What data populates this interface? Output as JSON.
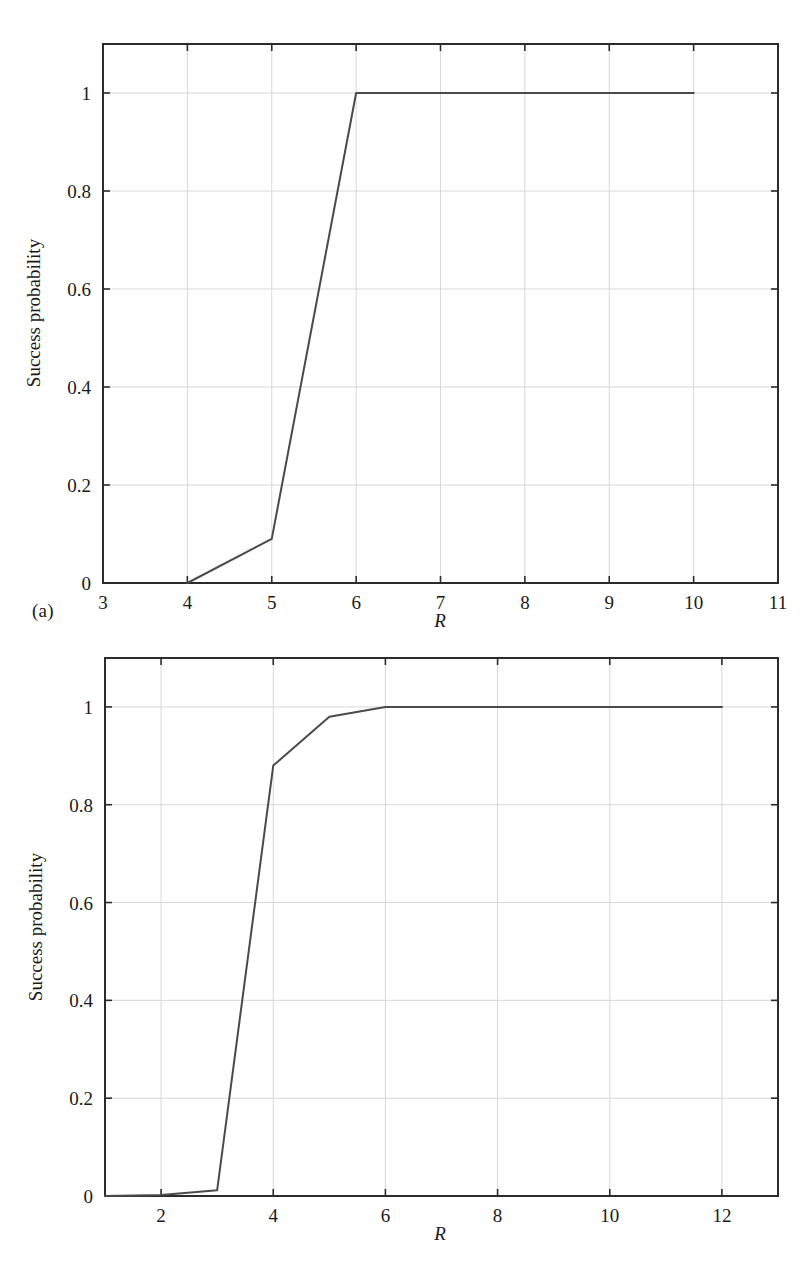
{
  "figure": {
    "panels": [
      {
        "id": "a",
        "label": "(a)",
        "xlabel": "R",
        "ylabel": "Success probability",
        "x_ticks": [
          "3",
          "4",
          "5",
          "6",
          "7",
          "8",
          "9",
          "10",
          "11"
        ],
        "y_ticks": [
          "0",
          "0.2",
          "0.4",
          "0.6",
          "0.8",
          "1"
        ]
      },
      {
        "id": "b",
        "label": "(b)",
        "xlabel": "R",
        "ylabel": "Success probability",
        "x_ticks": [
          "2",
          "4",
          "6",
          "8",
          "10",
          "12"
        ],
        "y_ticks": [
          "0",
          "0.2",
          "0.4",
          "0.6",
          "0.8",
          "1"
        ]
      }
    ],
    "colors": {
      "line": "#4a4a4a",
      "axis": "#2b2b2b",
      "grid": "#d8d8d8",
      "background": "#ffffff",
      "text": "#1a1a1a"
    }
  },
  "chart_data": [
    {
      "type": "line",
      "panel": "a",
      "title": "",
      "xlabel": "R",
      "ylabel": "Success probability",
      "xlim": [
        3,
        11
      ],
      "ylim": [
        0,
        1.1
      ],
      "xticks": [
        3,
        4,
        5,
        6,
        7,
        8,
        9,
        10,
        11
      ],
      "xticklabels": [
        "3",
        "4",
        "5",
        "6",
        "7",
        "8",
        "9",
        "10",
        "11"
      ],
      "yticks": [
        0,
        0.2,
        0.4,
        0.6,
        0.8,
        1
      ],
      "yticklabels": [
        "0",
        "0.2",
        "0.4",
        "0.6",
        "0.8",
        "1"
      ],
      "grid": true,
      "legend": null,
      "series": [
        {
          "name": "Success probability",
          "x": [
            4,
            5,
            6,
            7,
            8,
            9,
            10
          ],
          "values": [
            0,
            0.09,
            1.0,
            1.0,
            1.0,
            1.0,
            1.0
          ]
        }
      ]
    },
    {
      "type": "line",
      "panel": "b",
      "title": "",
      "xlabel": "R",
      "ylabel": "Success probability",
      "xlim": [
        1,
        13
      ],
      "ylim": [
        0,
        1.1
      ],
      "xticks": [
        2,
        4,
        6,
        8,
        10,
        12
      ],
      "xticklabels": [
        "2",
        "4",
        "6",
        "8",
        "10",
        "12"
      ],
      "yticks": [
        0,
        0.2,
        0.4,
        0.6,
        0.8,
        1
      ],
      "yticklabels": [
        "0",
        "0.2",
        "0.4",
        "0.6",
        "0.8",
        "1"
      ],
      "grid": true,
      "legend": null,
      "series": [
        {
          "name": "Success probability",
          "x": [
            1,
            2,
            3,
            4,
            5,
            6,
            7,
            8,
            9,
            10,
            11,
            12
          ],
          "values": [
            0,
            0.002,
            0.012,
            0.88,
            0.98,
            1.0,
            1.0,
            1.0,
            1.0,
            1.0,
            1.0,
            1.0
          ]
        }
      ]
    }
  ]
}
